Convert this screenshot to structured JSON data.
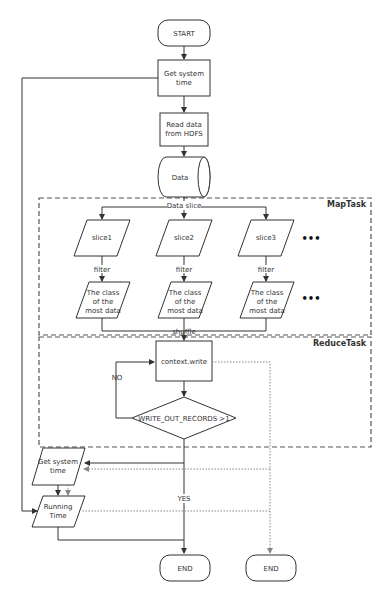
{
  "diagram": {
    "type": "flowchart",
    "nodes": {
      "start": "START",
      "get_time_1": [
        "Get system",
        "time"
      ],
      "read_hdfs": [
        "Read data",
        "from HDFS"
      ],
      "data": "Data",
      "slice1": "slice1",
      "slice2": "slice2",
      "slice3": "slice3",
      "class1": [
        "The class",
        "of the",
        "most data"
      ],
      "class2": [
        "The class",
        "of the",
        "most data"
      ],
      "class3": [
        "The class",
        "of the",
        "most data"
      ],
      "context_write": "context.write",
      "decision": "WRITE_OUT_RECORDS >1",
      "get_time_2": [
        "Get system",
        "time"
      ],
      "running_time": [
        "Running",
        "Time"
      ],
      "end1": "END",
      "end2": "END"
    },
    "labels": {
      "data_slice": "Data slice",
      "filter1": "filter",
      "filter2": "filter",
      "filter3": "filter",
      "shuffle": "shuffle",
      "no": "NO",
      "yes": "YES",
      "ellipsis": "•••"
    },
    "groups": {
      "maptask": "MapTask",
      "reducetask": "ReduceTask"
    },
    "colors": {
      "stroke": "#333333",
      "dotted": "#888888",
      "background": "#ffffff"
    }
  }
}
